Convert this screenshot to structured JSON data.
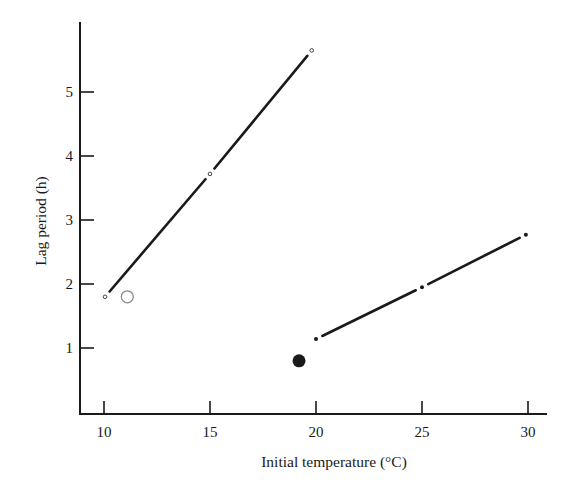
{
  "chart_data": {
    "type": "line",
    "title": "",
    "xlabel": "Initial temperature (°C)",
    "ylabel": "Lag period (h)",
    "xlim": [
      6.5,
      31
    ],
    "ylim": [
      0,
      6.0
    ],
    "xticks": [
      10,
      15,
      20,
      25,
      30
    ],
    "yticks": [
      1,
      2,
      3,
      4,
      5
    ],
    "grid": false,
    "legend": null,
    "series": [
      {
        "name": "upper line (open points)",
        "marker": "small-open-circle",
        "line": true,
        "points": [
          {
            "x": 10.05,
            "y": 1.8
          },
          {
            "x": 15.0,
            "y": 3.72
          },
          {
            "x": 19.8,
            "y": 5.65
          }
        ]
      },
      {
        "name": "lower line (filled points)",
        "marker": "small-filled-dot",
        "line": true,
        "points": [
          {
            "x": 20.0,
            "y": 1.14
          },
          {
            "x": 25.0,
            "y": 1.95
          },
          {
            "x": 29.9,
            "y": 2.77
          }
        ]
      },
      {
        "name": "large open circle",
        "marker": "large-open-circle",
        "line": false,
        "points": [
          {
            "x": 11.1,
            "y": 1.8
          }
        ]
      },
      {
        "name": "large filled circle",
        "marker": "large-filled-circle",
        "line": false,
        "points": [
          {
            "x": 19.2,
            "y": 0.8
          }
        ]
      }
    ]
  },
  "axes": {
    "x_tick_labels": [
      "10",
      "15",
      "20",
      "25",
      "30"
    ],
    "y_tick_labels": [
      "1",
      "2",
      "3",
      "4",
      "5"
    ],
    "xlabel": "Initial temperature (°C)",
    "ylabel": "Lag period (h)"
  },
  "colors": {
    "ink": "#1a1a1a",
    "open_circle_stroke": "#8a8a8a"
  }
}
